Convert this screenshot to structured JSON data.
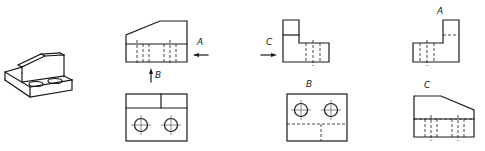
{
  "diagram": {
    "title": "",
    "type": "orthographic-projection",
    "labels": {
      "arrow_a": "A",
      "arrow_b": "B",
      "arrow_c": "C",
      "view_a": "A",
      "view_b": "B",
      "view_c": "C"
    },
    "views": [
      {
        "id": "isometric",
        "description": "Isometric view of L-shaped block with chamfered upright and two holes in base"
      },
      {
        "id": "front",
        "description": "Front view with chamfered top-left, hidden hole lines, viewing arrows A and B"
      },
      {
        "id": "top",
        "description": "Top view with two circles (holes) and step line"
      },
      {
        "id": "left-side",
        "description": "Side view with viewing arrow C, L-shaped profile"
      },
      {
        "id": "view-b",
        "description": "Auxiliary view B with two holes and hidden lines"
      },
      {
        "id": "view-a",
        "description": "Auxiliary view A mirrored L-shaped profile"
      },
      {
        "id": "view-c",
        "description": "Auxiliary view C with chamfered top-right"
      }
    ],
    "colors": {
      "line": "#1a1a1a",
      "background": "#ffffff"
    }
  }
}
